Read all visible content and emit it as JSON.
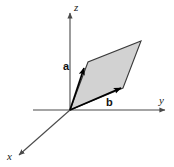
{
  "figure": {
    "width": 174,
    "height": 167,
    "background_color": "#ffffff"
  },
  "colors": {
    "axis": "#4a4a4a",
    "vector": "#000000",
    "parallelogram_fill": "#d2d2d2",
    "parallelogram_stroke": "#3a3a3a",
    "label": "#1a1a1a"
  },
  "axes": [
    {
      "name": "z",
      "label": "z",
      "from": [
        70,
        110
      ],
      "to": [
        70,
        13
      ],
      "label_pos": [
        74,
        10
      ]
    },
    {
      "name": "y",
      "label": "y",
      "from": [
        33,
        110
      ],
      "to": [
        165,
        110
      ],
      "label_pos": [
        160,
        103
      ]
    },
    {
      "name": "x",
      "label": "x",
      "from": [
        70,
        110
      ],
      "to": [
        19,
        155
      ],
      "label_pos": [
        8,
        157
      ]
    }
  ],
  "vectors": [
    {
      "name": "a",
      "label": "a",
      "from": [
        70,
        110
      ],
      "to": [
        84,
        68
      ],
      "label_pos": [
        66,
        66
      ]
    },
    {
      "name": "b",
      "label": "b",
      "from": [
        70,
        110
      ],
      "to": [
        121,
        88
      ],
      "label_pos": [
        108,
        103
      ]
    }
  ],
  "parallelogram": {
    "name": "parallelogram-ab",
    "vertices": [
      [
        70,
        110
      ],
      [
        88,
        62
      ],
      [
        141,
        41
      ],
      [
        123,
        88
      ]
    ],
    "points_attr": "70,110 88,62 141,41 123,88",
    "fill": "#d2d2d2",
    "stroke": "#3a3a3a"
  }
}
